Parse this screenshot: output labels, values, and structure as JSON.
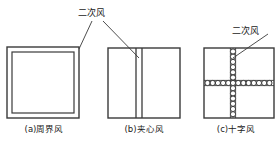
{
  "figure": {
    "labels": {
      "secondary_air_top": "二次风",
      "secondary_air_right": "二次风"
    },
    "captions": {
      "a": "(a)周界风",
      "b": "(b)夹心风",
      "c": "(c)十字风"
    },
    "colors": {
      "stroke": "#3a3a3a",
      "text": "#1a1a1a",
      "background": "#ffffff"
    },
    "diagrams": [
      {
        "id": "a",
        "type": "nested-rectangle",
        "caption": "(a)周界风",
        "outer": {
          "x": 7,
          "y": 47,
          "w": 72,
          "h": 71
        },
        "inner": {
          "x": 12,
          "y": 52,
          "w": 62,
          "h": 61
        }
      },
      {
        "id": "b",
        "type": "rectangle-with-center-band",
        "caption": "(b)夹心风",
        "outer": {
          "x": 108,
          "y": 48,
          "w": 72,
          "h": 70
        },
        "band": {
          "x1": 136,
          "x2": 142
        }
      },
      {
        "id": "c",
        "type": "rectangle-with-circle-cross",
        "caption": "(c)十字风",
        "outer": {
          "x": 204,
          "y": 48,
          "w": 70,
          "h": 70
        },
        "circle_radius": 2.6,
        "horizontal_circles": 13,
        "vertical_circles": 13,
        "center": {
          "x": 233,
          "y": 83
        }
      }
    ],
    "leaders": [
      {
        "from": [
          92,
          21
        ],
        "to": [
          79,
          49
        ],
        "target": "a"
      },
      {
        "from": [
          103,
          21
        ],
        "to": [
          139,
          57
        ],
        "target": "b"
      },
      {
        "from": [
          268,
          34
        ],
        "to": [
          233,
          58
        ],
        "target": "c"
      }
    ]
  }
}
